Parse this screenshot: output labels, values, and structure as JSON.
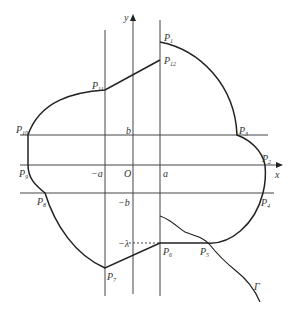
{
  "diagram": {
    "type": "geometric-region-diagram",
    "axes": {
      "x_label": "x",
      "y_label": "y",
      "origin_label": "O"
    },
    "tick_labels": {
      "neg_a": "−a",
      "a": "a",
      "b": "b",
      "neg_b": "−b",
      "neg_lambda": "−λ"
    },
    "points": [
      {
        "name": "P",
        "sub": "1"
      },
      {
        "name": "P",
        "sub": "2"
      },
      {
        "name": "P",
        "sub": "3"
      },
      {
        "name": "P",
        "sub": "4"
      },
      {
        "name": "P",
        "sub": "5"
      },
      {
        "name": "P",
        "sub": "6"
      },
      {
        "name": "P",
        "sub": "7"
      },
      {
        "name": "P",
        "sub": "8"
      },
      {
        "name": "P",
        "sub": "9"
      },
      {
        "name": "P",
        "sub": "10"
      },
      {
        "name": "P",
        "sub": "11"
      },
      {
        "name": "P",
        "sub": "12"
      }
    ],
    "curve_label": "Γ",
    "colors": {
      "stroke": "#222222",
      "grid": "#444444",
      "text": "#333333"
    }
  }
}
